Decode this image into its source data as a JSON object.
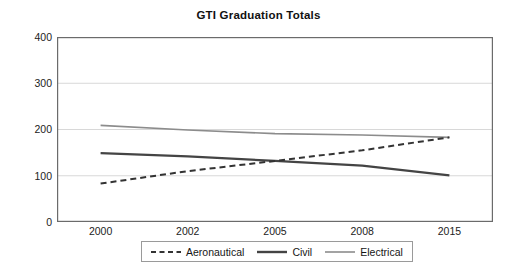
{
  "chart_data": {
    "type": "line",
    "title": "GTI Graduation Totals",
    "xlabel": "",
    "ylabel": "",
    "categories": [
      "2000",
      "2002",
      "2005",
      "2008",
      "2015"
    ],
    "ylim": [
      0,
      400
    ],
    "yticks": [
      "0",
      "100",
      "200",
      "300",
      "400"
    ],
    "grid": true,
    "legend_position": "bottom",
    "series": [
      {
        "name": "Aeronautical",
        "style": "dashed",
        "color": "#333333",
        "values": [
          83,
          110,
          132,
          155,
          183
        ]
      },
      {
        "name": "Civil",
        "style": "solid-thick",
        "color": "#444444",
        "values": [
          149,
          142,
          132,
          122,
          101
        ]
      },
      {
        "name": "Electrical",
        "style": "solid-thin",
        "color": "#8c8c8c",
        "values": [
          209,
          199,
          191,
          188,
          183
        ]
      }
    ]
  },
  "axes": {
    "plot_border_color": "#6b6b6b",
    "grid_color": "#d8d8d8",
    "tick_color": "#6b6b6b"
  }
}
